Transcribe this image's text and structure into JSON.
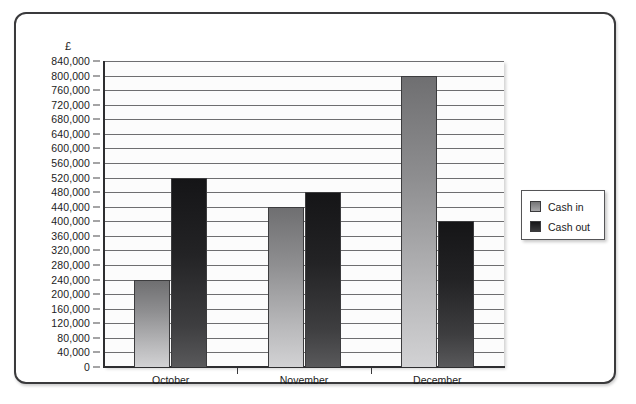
{
  "caption": "Question 5 is based on this bar chart.",
  "chart_data": {
    "type": "bar",
    "title": "",
    "currency_symbol": "£",
    "categories": [
      "October",
      "November",
      "December"
    ],
    "series": [
      {
        "name": "Cash in",
        "color": "#8e8e90",
        "values": [
          240000,
          440000,
          800000
        ]
      },
      {
        "name": "Cash out",
        "color": "#232325",
        "values": [
          520000,
          480000,
          400000
        ]
      }
    ],
    "xlabel": "",
    "ylabel": "£",
    "ylim": [
      0,
      840000
    ],
    "ytick_step": 40000,
    "ytick_labels": [
      "840,000",
      "800,000",
      "760,000",
      "720,000",
      "680,000",
      "640,000",
      "600,000",
      "560,000",
      "520,000",
      "480,000",
      "440,000",
      "400,000",
      "360,000",
      "320,000",
      "280,000",
      "240,000",
      "200,000",
      "160,000",
      "120,000",
      "80,000",
      "40,000",
      "0"
    ],
    "ytick_values": [
      840000,
      800000,
      760000,
      720000,
      680000,
      640000,
      600000,
      560000,
      520000,
      480000,
      440000,
      400000,
      360000,
      320000,
      280000,
      240000,
      200000,
      160000,
      120000,
      80000,
      40000,
      0
    ],
    "grid": true,
    "legend_position": "right"
  },
  "legend": {
    "items": [
      {
        "label": "Cash in",
        "swatch": "cash-in-swatch"
      },
      {
        "label": "Cash out",
        "swatch": "cash-out-swatch"
      }
    ]
  }
}
